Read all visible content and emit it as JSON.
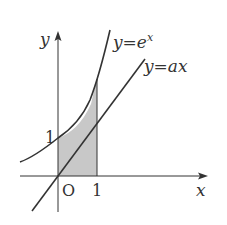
{
  "diagram": {
    "type": "function-graph",
    "axes": {
      "x_label": "x",
      "y_label": "y",
      "origin_label": "O",
      "x_tick_label": "1",
      "y_tick_label": "1"
    },
    "curves": [
      {
        "id": "exp",
        "label_prefix": "y=",
        "label_base": "e",
        "label_sup": "x",
        "expression": "y=e^x"
      },
      {
        "id": "line",
        "label": "y=ax",
        "expression": "y=ax"
      }
    ],
    "shaded_region": {
      "description": "region between y=e^x and y=ax from x=0 to x=1",
      "x_from": 0,
      "x_to": 1
    },
    "colors": {
      "stroke": "#333333",
      "shade": "#c8c8c8",
      "background": "#ffffff"
    }
  }
}
